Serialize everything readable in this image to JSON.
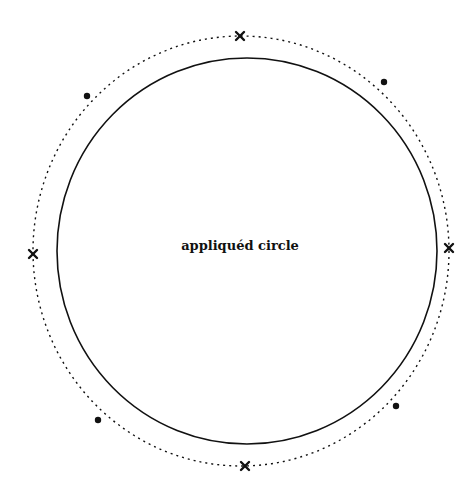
{
  "diagram": {
    "center_label": "appliquéd circle",
    "inner_circle": {
      "cx": 247,
      "cy": 251,
      "rx": 190,
      "ry": 193,
      "stroke": "#111111",
      "style": "solid"
    },
    "outer_circle": {
      "cx": 241,
      "cy": 251,
      "rx": 208,
      "ry": 215,
      "stroke": "#111111",
      "style": "dotted"
    },
    "cross_marks": [
      {
        "name": "top",
        "x": 240,
        "y": 36
      },
      {
        "name": "right",
        "x": 449,
        "y": 248
      },
      {
        "name": "bottom",
        "x": 245,
        "y": 466
      },
      {
        "name": "left",
        "x": 33,
        "y": 254
      }
    ],
    "dot_marks": [
      {
        "name": "upper-right",
        "x": 384,
        "y": 82
      },
      {
        "name": "upper-left",
        "x": 87,
        "y": 96
      },
      {
        "name": "lower-left",
        "x": 98,
        "y": 420
      },
      {
        "name": "lower-right",
        "x": 396,
        "y": 406
      }
    ]
  }
}
